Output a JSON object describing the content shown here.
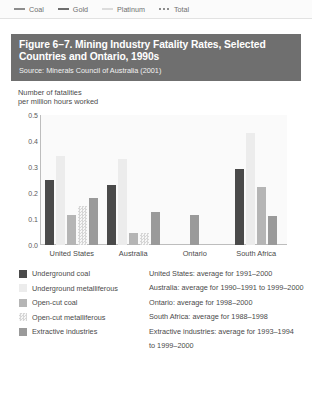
{
  "top_legend": {
    "items": [
      {
        "label": "Coal",
        "marker": "line-solid",
        "color": "#8d8d8d"
      },
      {
        "label": "Gold",
        "marker": "line-solid",
        "color": "#6e6e6e"
      },
      {
        "label": "Platinum",
        "marker": "line-solid",
        "color": "#d8d8d8"
      },
      {
        "label": "Total",
        "marker": "line-dotted",
        "color": "#8d8d8d"
      }
    ]
  },
  "figure": {
    "title": "Figure 6–7. Mining Industry Fatality Rates, Selected Countries and Ontario, 1990s",
    "source": "Source: Minerals Council of Australia (2001)",
    "header_bg": "#6f6f6f"
  },
  "chart_data": {
    "type": "bar",
    "title": "Mining Industry Fatality Rates, Selected Countries and Ontario, 1990s",
    "xlabel": "",
    "ylabel": "Number of fatalities per million hours worked",
    "ylabel_line1": "Number of fatalities",
    "ylabel_line2": "per million hours worked",
    "ylim": [
      0,
      0.5
    ],
    "yticks": [
      "0.0",
      "0.1",
      "0.2",
      "0.3",
      "0.4",
      "0.5"
    ],
    "ytick_values": [
      0.0,
      0.1,
      0.2,
      0.3,
      0.4,
      0.5
    ],
    "grid": false,
    "legend_position": "below",
    "categories": [
      "United States",
      "Australia",
      "Ontario",
      "South Africa"
    ],
    "series": [
      {
        "name": "Underground coal",
        "color": "#4a4a4a",
        "pattern": "solid",
        "values": [
          0.25,
          0.23,
          null,
          0.29
        ]
      },
      {
        "name": "Underground metalliferous",
        "color": "#ececec",
        "pattern": "solid",
        "values": [
          0.34,
          0.33,
          null,
          0.43
        ]
      },
      {
        "name": "Open-cut coal",
        "color": "#b5b5b5",
        "pattern": "solid",
        "values": [
          0.115,
          0.045,
          null,
          0.22
        ]
      },
      {
        "name": "Open-cut metalliferous",
        "color": "#d6d6d6",
        "pattern": "checkered",
        "values": [
          0.15,
          0.045,
          null,
          null
        ]
      },
      {
        "name": "Extractive industries",
        "color": "#9a9a9a",
        "pattern": "solid",
        "values": [
          0.18,
          0.125,
          0.115,
          0.11
        ]
      }
    ]
  },
  "legend": {
    "items": [
      {
        "label": "Underground coal",
        "color": "#4a4a4a",
        "pattern": "solid"
      },
      {
        "label": "Underground metalliferous",
        "color": "#ececec",
        "pattern": "solid"
      },
      {
        "label": "Open-cut coal",
        "color": "#b5b5b5",
        "pattern": "solid"
      },
      {
        "label": "Open-cut metalliferous",
        "color": "#d6d6d6",
        "pattern": "checkered"
      },
      {
        "label": "Extractive industries",
        "color": "#9a9a9a",
        "pattern": "solid"
      }
    ]
  },
  "notes": {
    "lines": [
      "United States: average for 1991–2000",
      "Australia: average for 1990–1991 to 1999–2000",
      "Ontario: average for 1998–2000",
      "South Africa: average for 1988–1998",
      "Extractive industries: average for 1993–1994"
    ],
    "continuation": "to 1999–2000"
  }
}
